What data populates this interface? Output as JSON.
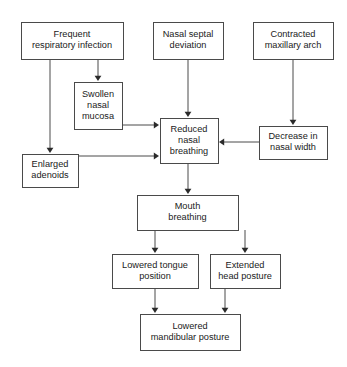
{
  "diagram": {
    "type": "flowchart",
    "background_color": "#ffffff",
    "box_stroke_color": "#4a4a4a",
    "text_color": "#1a1a1a",
    "arrow_color": "#2b2b2b",
    "nodes": [
      {
        "id": "frequent-respiratory-infection",
        "lines": [
          "Frequent",
          "respiratory infection"
        ],
        "x": 21,
        "y": 22,
        "w": 102,
        "h": 37
      },
      {
        "id": "nasal-septal-deviation",
        "lines": [
          "Nasal septal",
          "deviation"
        ],
        "x": 153,
        "y": 22,
        "w": 70,
        "h": 37
      },
      {
        "id": "contracted-maxillary-arch",
        "lines": [
          "Contracted",
          "maxillary arch"
        ],
        "x": 253,
        "y": 22,
        "w": 80,
        "h": 37
      },
      {
        "id": "swollen-nasal-mucosa",
        "lines": [
          "Swollen",
          "nasal",
          "mucosa"
        ],
        "x": 74,
        "y": 82,
        "w": 48,
        "h": 47
      },
      {
        "id": "reduced-nasal-breathing",
        "lines": [
          "Reduced",
          "nasal",
          "breathing"
        ],
        "x": 160,
        "y": 118,
        "w": 58,
        "h": 45
      },
      {
        "id": "decrease-in-nasal-width",
        "lines": [
          "Decrease in",
          "nasal width"
        ],
        "x": 259,
        "y": 126,
        "w": 68,
        "h": 33
      },
      {
        "id": "enlarged-adenoids",
        "lines": [
          "Enlarged",
          "adenoids"
        ],
        "x": 22,
        "y": 154,
        "w": 56,
        "h": 33
      },
      {
        "id": "mouth-breathing",
        "lines": [
          "Mouth",
          "breathing"
        ],
        "x": 137,
        "y": 195,
        "w": 101,
        "h": 35
      },
      {
        "id": "lowered-tongue-position",
        "lines": [
          "Lowered tongue",
          "position"
        ],
        "x": 112,
        "y": 254,
        "w": 86,
        "h": 34
      },
      {
        "id": "extended-head-posture",
        "lines": [
          "Extended",
          "head posture"
        ],
        "x": 210,
        "y": 254,
        "w": 70,
        "h": 34
      },
      {
        "id": "lowered-mandibular-posture",
        "lines": [
          "Lowered",
          "mandibular posture"
        ],
        "x": 140,
        "y": 314,
        "w": 100,
        "h": 36
      }
    ],
    "edges": [
      {
        "id": "edge-fri-to-swollen",
        "from": "frequent-respiratory-infection",
        "to": "swollen-nasal-mucosa",
        "path": "M 98 59 L 98 77",
        "arrow": {
          "x": 98,
          "y": 81,
          "dir": "down"
        }
      },
      {
        "id": "edge-fri-to-adenoids",
        "from": "frequent-respiratory-infection",
        "to": "enlarged-adenoids",
        "path": "M 50 59 L 50 149",
        "arrow": {
          "x": 50,
          "y": 153,
          "dir": "down"
        }
      },
      {
        "id": "edge-septal-to-reduced",
        "from": "nasal-septal-deviation",
        "to": "reduced-nasal-breathing",
        "path": "M 188 59 L 188 113",
        "arrow": {
          "x": 188,
          "y": 117,
          "dir": "down"
        }
      },
      {
        "id": "edge-maxillary-to-decrease",
        "from": "contracted-maxillary-arch",
        "to": "decrease-in-nasal-width",
        "path": "M 293 59 L 293 121",
        "arrow": {
          "x": 293,
          "y": 125,
          "dir": "down"
        }
      },
      {
        "id": "edge-swollen-to-reduced",
        "from": "swollen-nasal-mucosa",
        "to": "reduced-nasal-breathing",
        "path": "M 122 125 L 155 125",
        "arrow": {
          "x": 159,
          "y": 125,
          "dir": "right"
        }
      },
      {
        "id": "edge-adenoids-to-reduced",
        "from": "enlarged-adenoids",
        "to": "reduced-nasal-breathing",
        "path": "M 78 156 L 155 156",
        "arrow": {
          "x": 159,
          "y": 156,
          "dir": "right"
        }
      },
      {
        "id": "edge-decrease-to-reduced",
        "from": "decrease-in-nasal-width",
        "to": "reduced-nasal-breathing",
        "path": "M 259 142 L 223 142",
        "arrow": {
          "x": 219,
          "y": 142,
          "dir": "left"
        }
      },
      {
        "id": "edge-reduced-to-mouth",
        "from": "reduced-nasal-breathing",
        "to": "mouth-breathing",
        "path": "M 188 163 L 188 190",
        "arrow": {
          "x": 188,
          "y": 194,
          "dir": "down"
        }
      },
      {
        "id": "edge-mouth-to-tongue",
        "from": "mouth-breathing",
        "to": "lowered-tongue-position",
        "path": "M 155 230 L 155 249",
        "arrow": {
          "x": 155,
          "y": 253,
          "dir": "down"
        }
      },
      {
        "id": "edge-mouth-to-head",
        "from": "mouth-breathing",
        "to": "extended-head-posture",
        "path": "M 245 230 L 245 249",
        "arrow": {
          "x": 245,
          "y": 253,
          "dir": "down"
        }
      },
      {
        "id": "edge-tongue-to-mandibular",
        "from": "lowered-tongue-position",
        "to": "lowered-mandibular-posture",
        "path": "M 155 288 L 155 309",
        "arrow": {
          "x": 155,
          "y": 313,
          "dir": "down"
        }
      },
      {
        "id": "edge-head-to-mandibular",
        "from": "extended-head-posture",
        "to": "lowered-mandibular-posture",
        "path": "M 225 288 L 225 309",
        "arrow": {
          "x": 225,
          "y": 313,
          "dir": "down"
        }
      }
    ]
  }
}
